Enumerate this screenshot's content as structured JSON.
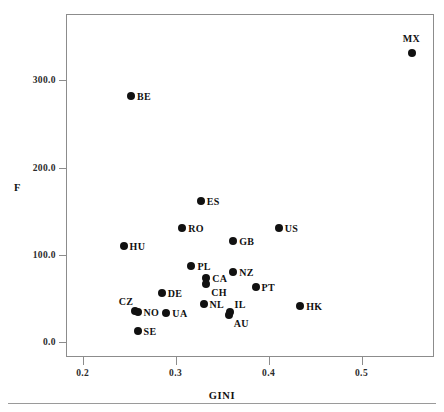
{
  "chart_data": {
    "type": "scatter",
    "title": "",
    "xlabel": "GINI",
    "ylabel": "F",
    "xlim": [
      0.182,
      0.578
    ],
    "ylim": [
      -17.0,
      376.0
    ],
    "xticks": [
      0.2,
      0.3,
      0.4,
      0.5
    ],
    "xtick_labels": [
      "0.2",
      "0.3",
      "0.4",
      "0.5"
    ],
    "yticks": [
      0.0,
      100.0,
      200.0,
      300.0
    ],
    "ytick_labels": [
      "0.0",
      "100.0",
      "200.0",
      "300.0"
    ],
    "grid": false,
    "legend": "none",
    "point_label_key": "country_code",
    "points": [
      {
        "label": "MX",
        "x": 0.554,
        "y": 331.0,
        "label_pos": "above"
      },
      {
        "label": "BE",
        "x": 0.252,
        "y": 282.0,
        "label_pos": "right"
      },
      {
        "label": "ES",
        "x": 0.327,
        "y": 162.0,
        "label_pos": "right"
      },
      {
        "label": "RO",
        "x": 0.307,
        "y": 131.0,
        "label_pos": "right"
      },
      {
        "label": "US",
        "x": 0.411,
        "y": 131.0,
        "label_pos": "right"
      },
      {
        "label": "GB",
        "x": 0.362,
        "y": 116.0,
        "label_pos": "right"
      },
      {
        "label": "HU",
        "x": 0.244,
        "y": 110.0,
        "label_pos": "right"
      },
      {
        "label": "PL",
        "x": 0.317,
        "y": 87.0,
        "label_pos": "right"
      },
      {
        "label": "NZ",
        "x": 0.362,
        "y": 80.0,
        "label_pos": "right"
      },
      {
        "label": "CA",
        "x": 0.333,
        "y": 73.0,
        "label_pos": "right"
      },
      {
        "label": "CH",
        "x": 0.333,
        "y": 67.0,
        "label_pos": "below-right"
      },
      {
        "label": "PT",
        "x": 0.386,
        "y": 63.0,
        "label_pos": "right"
      },
      {
        "label": "DE",
        "x": 0.285,
        "y": 56.0,
        "label_pos": "right"
      },
      {
        "label": "HK",
        "x": 0.434,
        "y": 41.0,
        "label_pos": "right"
      },
      {
        "label": "NL",
        "x": 0.33,
        "y": 44.0,
        "label_pos": "right"
      },
      {
        "label": "CZ",
        "x": 0.256,
        "y": 36.0,
        "label_pos": "above-left"
      },
      {
        "label": "NO",
        "x": 0.259,
        "y": 34.0,
        "label_pos": "right"
      },
      {
        "label": "UA",
        "x": 0.29,
        "y": 33.0,
        "label_pos": "right"
      },
      {
        "label": "IL",
        "x": 0.358,
        "y": 35.0,
        "label_pos": "above-right"
      },
      {
        "label": "AU",
        "x": 0.357,
        "y": 31.0,
        "label_pos": "below-right"
      },
      {
        "label": "SE",
        "x": 0.259,
        "y": 13.0,
        "label_pos": "right"
      }
    ]
  },
  "axes": {
    "x_title": "GINI",
    "y_title": "F"
  },
  "colors": {
    "point": "#111111",
    "frame": "#8c8c8c",
    "text": "#111111",
    "background": "#ffffff"
  }
}
